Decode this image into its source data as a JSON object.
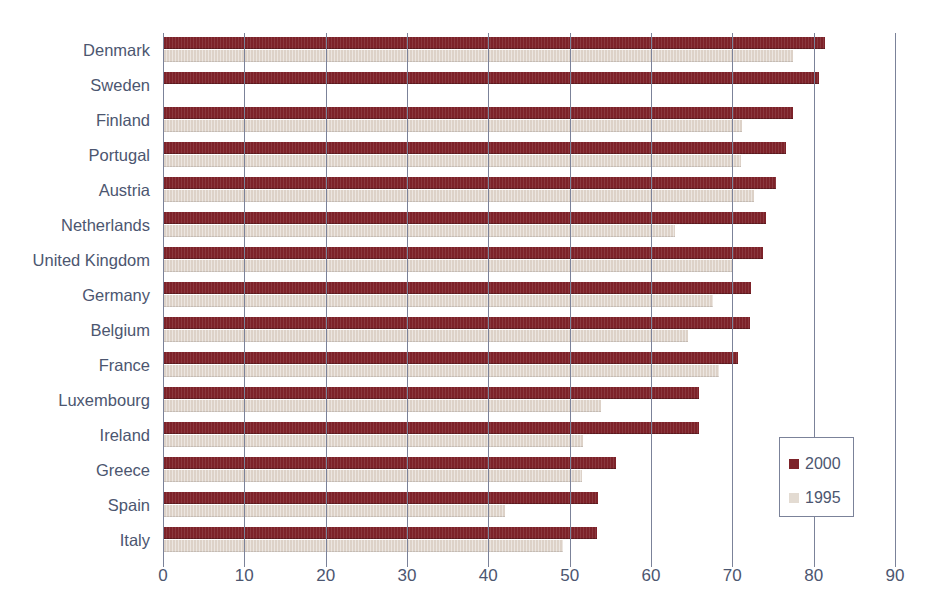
{
  "chart_data": {
    "type": "bar",
    "orientation": "horizontal",
    "title": "",
    "subtitle": "",
    "xlabel": "",
    "ylabel": "",
    "xlim": [
      0,
      90
    ],
    "xticks": [
      0,
      10,
      20,
      30,
      40,
      50,
      60,
      70,
      80,
      90
    ],
    "xtick_labels": [
      "0",
      "10",
      "20",
      "30",
      "40",
      "50",
      "60",
      "70",
      "80",
      "90"
    ],
    "grid": true,
    "grid_axis": "x",
    "legend_position": "bottom-right",
    "categories": [
      "Denmark",
      "Sweden",
      "Finland",
      "Portugal",
      "Austria",
      "Netherlands",
      "United Kingdom",
      "Germany",
      "Belgium",
      "France",
      "Luxembourg",
      "Ireland",
      "Greece",
      "Spain",
      "Italy"
    ],
    "series": [
      {
        "name": "2000",
        "color": "#7d2229",
        "values": [
          81.4,
          80.6,
          77.4,
          76.6,
          75.4,
          74.1,
          73.8,
          72.3,
          72.2,
          70.7,
          65.9,
          65.9,
          55.7,
          53.5,
          53.3
        ]
      },
      {
        "name": "1995",
        "color": "#ddd2c8",
        "values": [
          77.5,
          0,
          71.2,
          71.1,
          72.7,
          62.9,
          70.0,
          67.6,
          64.5,
          68.4,
          53.8,
          51.7,
          51.5,
          42.0,
          49.2
        ]
      }
    ]
  },
  "legend": {
    "items": [
      {
        "label": "2000",
        "color": "#7d2229"
      },
      {
        "label": "1995",
        "color": "#e3dbd2"
      }
    ]
  },
  "colors": {
    "axis": "#7b8299",
    "text": "#4c5670",
    "series_2000": "#7d2229",
    "series_1995": "#ddd2c8",
    "background": "#ffffff"
  }
}
